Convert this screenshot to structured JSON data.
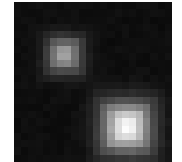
{
  "image": {
    "description": "Grayscale pixelated image with two blurred bright square spots on dark background",
    "background_color": "#0e0e0e",
    "page_color": "#ffffff",
    "grid": {
      "cols": 22,
      "rows": 22,
      "cell_px": 7.2
    },
    "blobs": [
      {
        "name": "small-blob",
        "cx": 7.0,
        "cy": 7.3,
        "sigma": 1.6,
        "peak": 0.62
      },
      {
        "name": "large-blob",
        "cx": 15.7,
        "cy": 17.2,
        "sigma": 2.3,
        "peak": 0.95
      }
    ],
    "base_level": 0.055
  }
}
